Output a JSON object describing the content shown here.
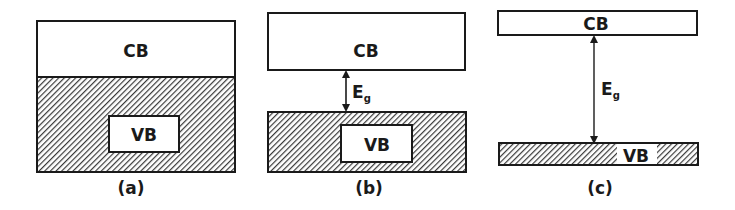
{
  "diagram": {
    "colors": {
      "line": "#1a1a1a",
      "hatch": "#3a3a3a",
      "background": "#ffffff"
    },
    "panels": [
      {
        "id": "a",
        "caption": "(a)",
        "cb_label": "CB",
        "vb_label": "VB",
        "gap_label": null
      },
      {
        "id": "b",
        "caption": "(b)",
        "cb_label": "CB",
        "vb_label": "VB",
        "gap_label": "E",
        "gap_subscript": "g"
      },
      {
        "id": "c",
        "caption": "(c)",
        "cb_label": "CB",
        "vb_label": "VB",
        "gap_label": "E",
        "gap_subscript": "g"
      }
    ]
  }
}
